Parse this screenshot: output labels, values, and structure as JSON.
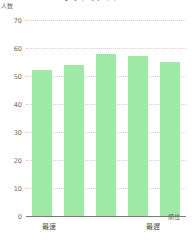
{
  "chart_data": {
    "type": "bar",
    "title": "",
    "xlabel": "順位",
    "ylabel": "人数",
    "categories": [
      "1",
      "2",
      "3",
      "4",
      "5"
    ],
    "values": [
      52,
      54,
      58,
      57,
      55
    ],
    "ylim": [
      0,
      70
    ],
    "yticks": [
      0,
      10,
      20,
      30,
      40,
      50,
      60,
      70
    ],
    "ytick_labels": [
      "0",
      "10",
      "20",
      "30",
      "40",
      "50",
      "60",
      "70"
    ],
    "x_endpoint_labels": {
      "left": "最速",
      "right": "最遅"
    },
    "grid": true,
    "legend": false,
    "bar_color": "#9fe8a6",
    "gridline_color": "#e3c9cd",
    "axis_color": "#7b7b7b"
  },
  "axes": {
    "y_unit_caption": "人数",
    "x_unit_caption": "順位"
  },
  "title_strip": {
    "text": "グラフのタイトル"
  }
}
